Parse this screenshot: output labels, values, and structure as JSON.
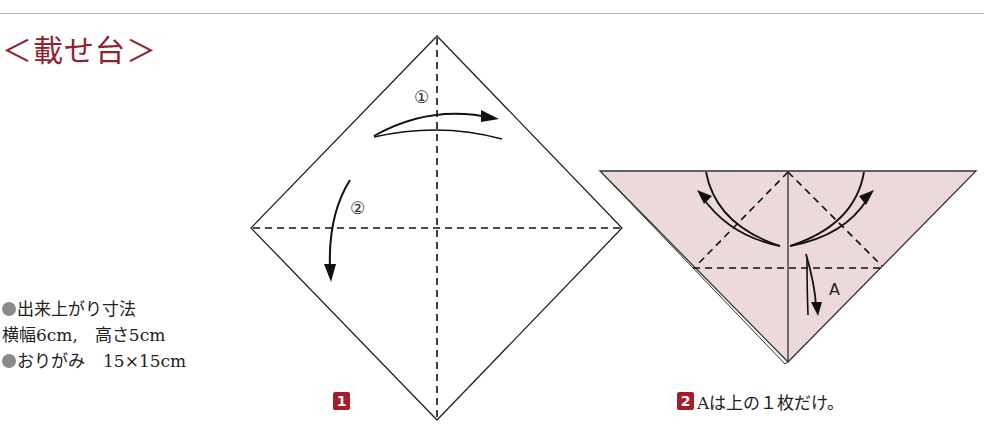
{
  "title": "＜載せ台＞",
  "specs": {
    "finished_size_label": "出来上がり寸法",
    "finished_size_value": "横幅6cm,　高さ5cm",
    "paper_label": "おりがみ",
    "paper_value": "15×15cm"
  },
  "steps": [
    {
      "number": "1",
      "caption": "",
      "arrow_labels": [
        "①",
        "②"
      ]
    },
    {
      "number": "2",
      "caption": "Aは上の１枚だけ。",
      "flap_label": "A"
    }
  ],
  "colors": {
    "title": "#8e2230",
    "badge": "#a51d2b",
    "paper_pink": "#ecd9da",
    "bullet": "#8a8a8a"
  }
}
